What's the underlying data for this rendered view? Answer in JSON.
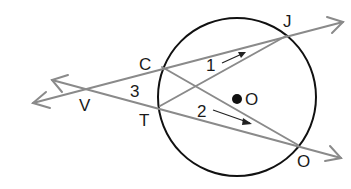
{
  "diagram": {
    "type": "circle-secants",
    "circle": {
      "center_label": "O",
      "cx": 237,
      "cy": 97,
      "r": 79
    },
    "points": {
      "V": {
        "label": "V",
        "x": 87,
        "y": 90
      },
      "C": {
        "label": "C",
        "x": 162,
        "y": 67
      },
      "T": {
        "label": "T",
        "x": 160,
        "y": 106
      },
      "J": {
        "label": "J",
        "x": 286,
        "y": 36
      },
      "O2": {
        "label": "O",
        "x": 298,
        "y": 145
      }
    },
    "angles": {
      "angle1": {
        "label": "1"
      },
      "angle2": {
        "label": "2"
      },
      "angle3": {
        "label": "3"
      }
    },
    "lines": [
      {
        "name": "ray-VJ",
        "from": "upper-left-arrow",
        "through": [
          "V",
          "C",
          "J"
        ]
      },
      {
        "name": "ray-VO",
        "from": "lower-left-arrow",
        "through": [
          "V",
          "T",
          "O2"
        ]
      },
      {
        "name": "chord-CO",
        "through": [
          "C",
          "O2"
        ]
      },
      {
        "name": "chord-TJ",
        "through": [
          "T",
          "J"
        ]
      }
    ],
    "colors": {
      "lines": "#8a8a8a",
      "circle": "#111111",
      "text": "#1a1a1a"
    }
  }
}
